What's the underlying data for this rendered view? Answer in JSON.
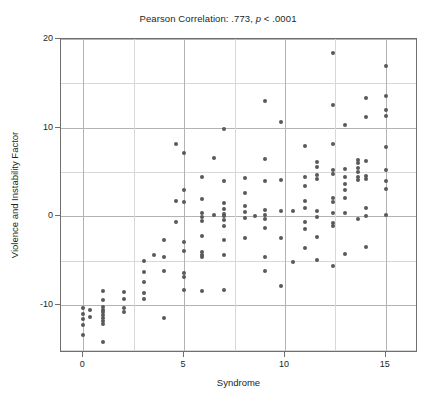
{
  "chart_data": {
    "type": "scatter",
    "title": "Pearson Correlation: .773, p < .0001",
    "title_parts": {
      "prefix": "Pearson Correlation: .773, ",
      "italic": "p",
      "suffix": " < .0001"
    },
    "xlabel": "Syndrome",
    "ylabel": "Violence and Instability Factor",
    "xlim": [
      -1.1,
      16.6
    ],
    "ylim": [
      -15.4,
      20.0
    ],
    "xticks": [
      0,
      5,
      10,
      15
    ],
    "xtick_labels": [
      "0",
      "5",
      "10",
      "15"
    ],
    "yticks": [
      -10,
      0,
      10,
      20
    ],
    "ytick_labels": [
      "-10",
      "0",
      "10",
      "20"
    ],
    "gridlines_x": [
      0,
      2.5,
      5,
      7.5,
      10,
      12.5,
      15
    ],
    "gridlines_y": [
      -15,
      -10,
      -5,
      0,
      5,
      10,
      15,
      20
    ],
    "grid": true,
    "legend": null,
    "marker_color": "#595959",
    "axis_color": "#6f6f6f",
    "grid_color": "#c9c9c9",
    "correlation": 0.773,
    "p_value": "< .0001",
    "points": [
      [
        0,
        -10.3
      ],
      [
        0,
        -11.0
      ],
      [
        0,
        -11.6
      ],
      [
        0,
        -12.2
      ],
      [
        0,
        -13.4
      ],
      [
        0.35,
        -10.6
      ],
      [
        0.35,
        -11.3
      ],
      [
        1,
        -8.4
      ],
      [
        1,
        -9.4
      ],
      [
        1,
        -10.2
      ],
      [
        1,
        -10.5
      ],
      [
        1,
        -10.8
      ],
      [
        1,
        -11.1
      ],
      [
        1,
        -11.4
      ],
      [
        1,
        -11.8
      ],
      [
        1,
        -12.1
      ],
      [
        1,
        -14.2
      ],
      [
        2,
        -8.5
      ],
      [
        2,
        -9.3
      ],
      [
        2,
        -10.3
      ],
      [
        2,
        -10.8
      ],
      [
        3,
        -5.0
      ],
      [
        3,
        -6.3
      ],
      [
        3,
        -7.4
      ],
      [
        3,
        -8.6
      ],
      [
        3,
        -9.3
      ],
      [
        3.5,
        -4.3
      ],
      [
        4,
        -2.7
      ],
      [
        4,
        -4.6
      ],
      [
        4,
        -6.2
      ],
      [
        4,
        -11.5
      ],
      [
        4.6,
        8.2
      ],
      [
        4.6,
        1.7
      ],
      [
        4.6,
        -0.6
      ],
      [
        5,
        7.1
      ],
      [
        5,
        3.0
      ],
      [
        5,
        1.6
      ],
      [
        5,
        -2.9
      ],
      [
        5,
        -3.9
      ],
      [
        5,
        -6.4
      ],
      [
        5,
        -6.8
      ],
      [
        5,
        -8.3
      ],
      [
        5.9,
        4.5
      ],
      [
        5.9,
        2.0
      ],
      [
        5.9,
        0.4
      ],
      [
        5.9,
        -0.1
      ],
      [
        5.9,
        -0.5
      ],
      [
        5.9,
        -2.2
      ],
      [
        5.9,
        -4.0
      ],
      [
        5.9,
        -4.3
      ],
      [
        5.9,
        -4.6
      ],
      [
        5.9,
        -8.4
      ],
      [
        6.5,
        6.6
      ],
      [
        6.5,
        0.2
      ],
      [
        7,
        9.9
      ],
      [
        7,
        4.0
      ],
      [
        7,
        1.5
      ],
      [
        7,
        0.8
      ],
      [
        7,
        0.3
      ],
      [
        7,
        0.0
      ],
      [
        7,
        -0.4
      ],
      [
        7,
        -1.1
      ],
      [
        7,
        -2.6
      ],
      [
        7,
        -4.3
      ],
      [
        7,
        -8.3
      ],
      [
        8,
        4.3
      ],
      [
        8,
        2.6
      ],
      [
        8,
        1.2
      ],
      [
        8,
        0.5
      ],
      [
        8,
        -0.2
      ],
      [
        8,
        -2.4
      ],
      [
        8.5,
        0.1
      ],
      [
        9,
        13.0
      ],
      [
        9,
        6.5
      ],
      [
        9,
        4.0
      ],
      [
        9,
        0.7
      ],
      [
        9,
        0.2
      ],
      [
        9,
        -0.3
      ],
      [
        9,
        -1.3
      ],
      [
        9,
        -4.6
      ],
      [
        9,
        -6.1
      ],
      [
        9.8,
        10.7
      ],
      [
        9.8,
        4.1
      ],
      [
        9.8,
        0.6
      ],
      [
        9.8,
        -2.4
      ],
      [
        9.8,
        -7.8
      ],
      [
        10.4,
        0.6
      ],
      [
        10.4,
        -5.1
      ],
      [
        11,
        7.9
      ],
      [
        11,
        4.4
      ],
      [
        11,
        3.4
      ],
      [
        11,
        1.7
      ],
      [
        11,
        0.9
      ],
      [
        11,
        -0.6
      ],
      [
        11,
        -1.4
      ],
      [
        11,
        -3.6
      ],
      [
        11.6,
        6.1
      ],
      [
        11.6,
        5.6
      ],
      [
        11.6,
        4.7
      ],
      [
        11.6,
        4.2
      ],
      [
        11.6,
        0.6
      ],
      [
        11.6,
        -0.1
      ],
      [
        11.6,
        -2.3
      ],
      [
        11.6,
        -4.9
      ],
      [
        12.4,
        18.4
      ],
      [
        12.4,
        12.6
      ],
      [
        12.4,
        8.2
      ],
      [
        12.4,
        5.2
      ],
      [
        12.4,
        4.8
      ],
      [
        12.4,
        2.1
      ],
      [
        12.4,
        1.6
      ],
      [
        12.4,
        0.4
      ],
      [
        12.4,
        -0.7
      ],
      [
        12.4,
        -1.1
      ],
      [
        12.4,
        -5.6
      ],
      [
        13,
        10.3
      ],
      [
        13,
        5.4
      ],
      [
        13,
        4.5
      ],
      [
        13,
        3.7
      ],
      [
        13,
        3.0
      ],
      [
        13,
        2.1
      ],
      [
        13,
        0.4
      ],
      [
        13,
        -4.2
      ],
      [
        13.6,
        6.4
      ],
      [
        13.6,
        6.0
      ],
      [
        13.6,
        5.5
      ],
      [
        13.6,
        5.0
      ],
      [
        13.6,
        4.5
      ],
      [
        13.6,
        4.1
      ],
      [
        13.6,
        -0.3
      ],
      [
        14,
        13.4
      ],
      [
        14,
        11.2
      ],
      [
        14,
        6.3
      ],
      [
        14,
        4.6
      ],
      [
        14,
        4.2
      ],
      [
        14,
        0.9
      ],
      [
        14,
        0.1
      ],
      [
        14,
        -3.5
      ],
      [
        15,
        17.0
      ],
      [
        15,
        13.6
      ],
      [
        15,
        12.0
      ],
      [
        15,
        11.3
      ],
      [
        15,
        7.8
      ],
      [
        15,
        5.2
      ],
      [
        15,
        4.0
      ],
      [
        15,
        3.1
      ],
      [
        15,
        0.2
      ]
    ]
  }
}
